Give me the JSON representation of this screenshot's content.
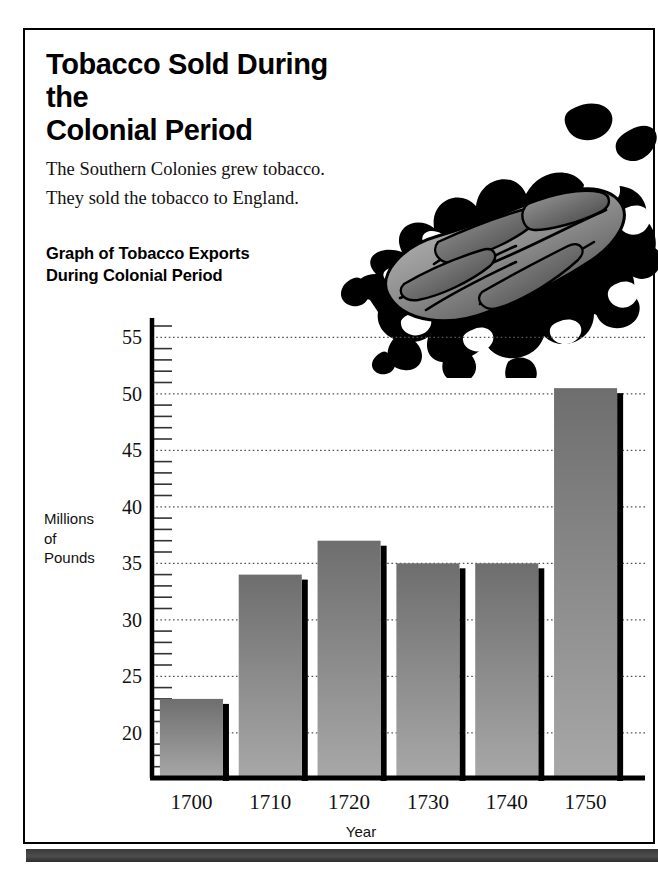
{
  "page": {
    "title_line1": "Tobacco Sold During the",
    "title_line2": "Colonial Period",
    "intro_line1": "The Southern Colonies grew tobacco.",
    "intro_line2": "They sold the tobacco to England.",
    "chart_heading_line1": "Graph of Tobacco Exports",
    "chart_heading_line2": "During Colonial Period",
    "illustration": "tobacco-leaf-illustration"
  },
  "colors": {
    "ink": "#000000",
    "bar_top": "#6e6e6e",
    "bar_bottom": "#a8a8a8",
    "bar_shadow": "#000000",
    "gridline": "#555555",
    "band": "#3a3a3a"
  },
  "chart_data": {
    "type": "bar",
    "title": "Graph of Tobacco Exports During Colonial Period",
    "xlabel": "Year",
    "ylabel": "Millions of Pounds",
    "categories": [
      "1700",
      "1710",
      "1720",
      "1730",
      "1740",
      "1750"
    ],
    "values": [
      23,
      34,
      37,
      35,
      35,
      50.5
    ],
    "ylim": [
      16,
      56
    ],
    "ytick_labels": [
      "20",
      "25",
      "30",
      "35",
      "40",
      "45",
      "50",
      "55"
    ],
    "ytick_values": [
      20,
      25,
      30,
      35,
      40,
      45,
      50,
      55
    ],
    "minor_tick_step": 1,
    "grid": true,
    "grid_style": "dotted-horizontal",
    "legend": "none"
  }
}
